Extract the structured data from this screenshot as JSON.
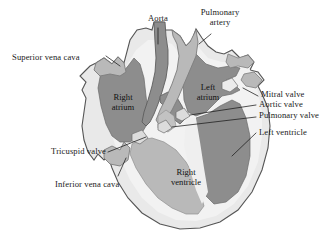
{
  "figure": {
    "background_color": "#ffffff"
  },
  "palette": {
    "outline": "#4a4a4a",
    "chamber_dark": "#8a8a8a",
    "vessel_medium": "#b8b8b8",
    "myocardium_light": "#e8e8e8",
    "myocardium_pale": "#f1f1f1",
    "leader_line": "#1a1a1a",
    "text": "#1a1a1a"
  },
  "callouts": {
    "aorta": "Aorta",
    "pulmonary_artery_line1": "Pulmonary",
    "pulmonary_artery_line2": "artery",
    "superior_vena_cava": "Superior vena cava",
    "mitral_valve": "Mitral valve",
    "aortic_valve": "Aortic valve",
    "pulmonary_valve": "Pulmonary valve",
    "left_ventricle": "Left ventricle",
    "tricuspid_valve": "Tricuspid valve",
    "inferior_vena_cava": "Inferior vena cava"
  },
  "chambers": {
    "right_atrium_line1": "Right",
    "right_atrium_line2": "atrium",
    "left_atrium_line1": "Left",
    "left_atrium_line2": "atrium",
    "right_ventricle_line1": "Right",
    "right_ventricle_line2": "ventricle"
  }
}
